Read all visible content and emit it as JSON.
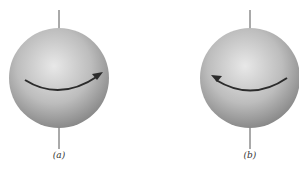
{
  "figure": {
    "panels": [
      {
        "label": "(a)",
        "rotation": "clockwise-arrow-right",
        "center": [
          59,
          78
        ],
        "radius": 50
      },
      {
        "label": "(b)",
        "rotation": "counterclockwise-arrow-left",
        "center": [
          250,
          78
        ],
        "radius": 50
      }
    ],
    "colors": {
      "sphere_light": "#e6e6e6",
      "sphere_dark": "#8a8a8a",
      "arrow": "#2b2b2b",
      "axis": "#555555"
    }
  }
}
